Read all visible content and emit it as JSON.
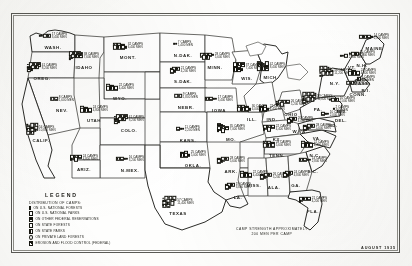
{
  "map": {
    "title": "Distribution of Civilian Conservation Corps Camps",
    "date_stamp": "AUGUST 1935",
    "note": "CAMP STRENGTH APPROXIMATELY\n200 MEN PER CAMP",
    "note_line1": "CAMP STRENGTH APPROXIMATELY",
    "note_line2": "200 MEN PER CAMP"
  },
  "legend": {
    "title": "LEGEND",
    "subtitle": "DISTRIBUTION OF CAMPS:",
    "items": [
      {
        "symbol": "filled-bar",
        "label": "ON U.S. NATIONAL FORESTS"
      },
      {
        "symbol": "open-bar",
        "label": "ON U.S. NATIONAL PARKS"
      },
      {
        "symbol": "half-bar",
        "label": "ON OTHER FEDERAL RESERVATIONS"
      },
      {
        "symbol": "hatched-bar",
        "label": "ON STATE FORESTS"
      },
      {
        "symbol": "split-bar",
        "label": "ON STATE PARKS"
      },
      {
        "symbol": "open-circle",
        "label": "ON PRIVATE LAND FORESTS"
      },
      {
        "symbol": "diag-bar",
        "label": "EROSION AND FLOOD CONTROL (FEDERAL)"
      }
    ]
  },
  "states": [
    {
      "abbr": "WASH.",
      "x": 53,
      "y": 42,
      "camps": "17 CAMPS",
      "men": "3,400 MEN"
    },
    {
      "abbr": "OREG.",
      "x": 42,
      "y": 73,
      "camps": "41 CAMPS",
      "men": "8,200 MEN"
    },
    {
      "abbr": "IDAHO",
      "x": 84,
      "y": 62,
      "camps": "38 CAMPS",
      "men": "7,600 MEN"
    },
    {
      "abbr": "MONT.",
      "x": 128,
      "y": 52,
      "camps": "32 CAMPS",
      "men": "6,400 MEN"
    },
    {
      "abbr": "WYO.",
      "x": 120,
      "y": 93,
      "camps": "22 CAMPS",
      "men": "4,400 MEN"
    },
    {
      "abbr": "N.DAK.",
      "x": 183,
      "y": 50,
      "camps": "7 CAMPS",
      "men": "1,400 MEN"
    },
    {
      "abbr": "S.DAK.",
      "x": 183,
      "y": 76,
      "camps": "21 CAMPS",
      "men": "4,200 MEN"
    },
    {
      "abbr": "NEBR.",
      "x": 186,
      "y": 102,
      "camps": "9 CAMPS",
      "men": "1,800 MEN"
    },
    {
      "abbr": "NEV.",
      "x": 62,
      "y": 105,
      "camps": "8 CAMPS",
      "men": "1,600 MEN"
    },
    {
      "abbr": "UTAH",
      "x": 94,
      "y": 115,
      "camps": "24 CAMPS",
      "men": "4,800 MEN"
    },
    {
      "abbr": "CALIF.",
      "x": 41,
      "y": 135,
      "camps": "54 CAMPS",
      "men": "10,800 MEN"
    },
    {
      "abbr": "COLO.",
      "x": 129,
      "y": 125,
      "camps": "41 CAMPS",
      "men": "8,200 MEN"
    },
    {
      "abbr": "ARIZ.",
      "x": 84,
      "y": 164,
      "camps": "24 CAMPS",
      "men": "4,800 MEN"
    },
    {
      "abbr": "N.MEX.",
      "x": 130,
      "y": 165,
      "camps": "16 CAMPS",
      "men": "3,200 MEN"
    },
    {
      "abbr": "KANS.",
      "x": 188,
      "y": 135,
      "camps": "11 CAMPS",
      "men": "2,200 MEN"
    },
    {
      "abbr": "OKLA.",
      "x": 193,
      "y": 160,
      "camps": "25 CAMPS",
      "men": "5,000 MEN"
    },
    {
      "abbr": "TEXAS",
      "x": 178,
      "y": 208,
      "camps": "57 CAMPS",
      "men": "11,400 MEN"
    },
    {
      "abbr": "MINN.",
      "x": 215,
      "y": 62,
      "camps": "28 CAMPS",
      "men": "5,600 MEN"
    },
    {
      "abbr": "IOWA",
      "x": 219,
      "y": 105,
      "camps": "17 CAMPS",
      "men": "3,400 MEN"
    },
    {
      "abbr": "MO.",
      "x": 231,
      "y": 134,
      "camps": "35 CAMPS",
      "men": "7,000 MEN"
    },
    {
      "abbr": "ARK.",
      "x": 231,
      "y": 166,
      "camps": "28 CAMPS",
      "men": "5,600 MEN"
    },
    {
      "abbr": "LA.",
      "x": 238,
      "y": 192,
      "camps": "19 CAMPS",
      "men": "3,800 MEN"
    },
    {
      "abbr": "WIS.",
      "x": 247,
      "y": 73,
      "camps": "37 CAMPS",
      "men": "7,400 MEN"
    },
    {
      "abbr": "ILL.",
      "x": 252,
      "y": 114,
      "camps": "30 CAMPS",
      "men": "6,000 MEN"
    },
    {
      "abbr": "MICH.",
      "x": 271,
      "y": 72,
      "camps": "42 CAMPS",
      "men": "8,400 MEN"
    },
    {
      "abbr": "IND.",
      "x": 272,
      "y": 114,
      "camps": "22 CAMPS",
      "men": "4,400 MEN"
    },
    {
      "abbr": "OHIO",
      "x": 291,
      "y": 109,
      "camps": "26 CAMPS",
      "men": "5,200 MEN"
    },
    {
      "abbr": "KY.",
      "x": 277,
      "y": 134,
      "camps": "22 CAMPS",
      "men": "4,400 MEN"
    },
    {
      "abbr": "TENN.",
      "x": 277,
      "y": 150,
      "camps": "28 CAMPS",
      "men": "5,600 MEN"
    },
    {
      "abbr": "MISS.",
      "x": 254,
      "y": 180,
      "camps": "22 CAMPS",
      "men": "4,400 MEN"
    },
    {
      "abbr": "ALA.",
      "x": 274,
      "y": 182,
      "camps": "26 CAMPS",
      "men": "5,200 MEN"
    },
    {
      "abbr": "GA.",
      "x": 296,
      "y": 180,
      "camps": "24 CAMPS",
      "men": "4,800 MEN"
    },
    {
      "abbr": "FLA.",
      "x": 313,
      "y": 206,
      "camps": "21 CAMPS",
      "men": "4,200 MEN"
    },
    {
      "abbr": "S.C.",
      "x": 313,
      "y": 166,
      "camps": "14 CAMPS",
      "men": "2,800 MEN"
    },
    {
      "abbr": "N.C.",
      "x": 315,
      "y": 150,
      "camps": "22 CAMPS",
      "men": "4,400 MEN"
    },
    {
      "abbr": "VA.",
      "x": 317,
      "y": 133,
      "camps": "28 CAMPS",
      "men": "5,600 MEN"
    },
    {
      "abbr": "W.VA.",
      "x": 300,
      "y": 126,
      "camps": "20 CAMPS",
      "men": "4,000 MEN"
    },
    {
      "abbr": "PA.",
      "x": 318,
      "y": 104,
      "camps": "59 CAMPS",
      "men": "11,800 MEN"
    },
    {
      "abbr": "N.Y.",
      "x": 335,
      "y": 78,
      "camps": "56 CAMPS",
      "men": "11,200 MEN"
    },
    {
      "abbr": "MD.",
      "x": 333,
      "y": 120,
      "camps": "10 CAMPS",
      "men": "2,000 MEN"
    },
    {
      "abbr": "DEL.",
      "x": 341,
      "y": 115,
      "camps": "2 CAMPS",
      "men": "400 MEN"
    },
    {
      "abbr": "N.J.",
      "x": 342,
      "y": 106,
      "camps": "10 CAMPS",
      "men": "2,000 MEN"
    },
    {
      "abbr": "CONN.",
      "x": 358,
      "y": 89,
      "camps": "9 CAMPS",
      "men": "1,800 MEN"
    },
    {
      "abbr": "R.I.",
      "x": 366,
      "y": 85,
      "camps": "3 CAMPS",
      "men": "600 MEN"
    },
    {
      "abbr": "MASS.",
      "x": 362,
      "y": 78,
      "camps": "24 CAMPS",
      "men": "4,800 MEN"
    },
    {
      "abbr": "VT.",
      "x": 352,
      "y": 62,
      "camps": "12 CAMPS",
      "men": "2,400 MEN"
    },
    {
      "abbr": "N.H.",
      "x": 362,
      "y": 60,
      "camps": "10 CAMPS",
      "men": "2,000 MEN"
    },
    {
      "abbr": "MAINE",
      "x": 374,
      "y": 43,
      "camps": "14 CAMPS",
      "men": "2,800 MEN"
    }
  ]
}
